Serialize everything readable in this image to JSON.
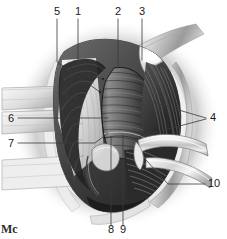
{
  "figure": {
    "medium": "grayscale pen-and-ink / airbrush medical illustration",
    "background_color": "#ffffff",
    "ink_color": "#3a3a3a",
    "width": 227,
    "height": 239,
    "signature": "Mc"
  },
  "labels": [
    {
      "id": "label-5",
      "text": "5",
      "x": 57,
      "y": 15,
      "position": "top"
    },
    {
      "id": "label-1",
      "text": "1",
      "x": 78,
      "y": 15,
      "position": "top"
    },
    {
      "id": "label-2",
      "text": "2",
      "x": 118,
      "y": 15,
      "position": "top"
    },
    {
      "id": "label-3",
      "text": "3",
      "x": 142,
      "y": 15,
      "position": "top"
    },
    {
      "id": "label-6",
      "text": "6",
      "x": 11,
      "y": 122,
      "position": "left"
    },
    {
      "id": "label-7",
      "text": "7",
      "x": 11,
      "y": 147,
      "position": "left"
    },
    {
      "id": "label-4",
      "text": "4",
      "x": 213,
      "y": 121,
      "position": "right"
    },
    {
      "id": "label-10",
      "text": "10",
      "x": 213,
      "y": 187,
      "position": "right"
    },
    {
      "id": "label-8",
      "text": "8",
      "x": 111,
      "y": 233,
      "position": "bottom"
    },
    {
      "id": "label-9",
      "text": "9",
      "x": 123,
      "y": 233,
      "position": "bottom"
    }
  ],
  "leaders": [
    {
      "id": "leader-5",
      "for": "5",
      "path": "M 57 19 L 57 62 L 100 92"
    },
    {
      "id": "leader-1",
      "for": "1",
      "path": "M 78 19 L 78 72 L 103 79"
    },
    {
      "id": "leader-2",
      "for": "2",
      "path": "M 118 19 L 118 68"
    },
    {
      "id": "leader-3",
      "for": "3",
      "path": "M 142 19 L 142 60"
    },
    {
      "id": "leader-6",
      "for": "6",
      "path": "M 18 118 L 108 118"
    },
    {
      "id": "leader-7",
      "for": "7",
      "path": "M 18 143 L 95 143 L 108 133"
    },
    {
      "id": "leader-4a",
      "for": "4",
      "path": "M 206 118 L 148 101"
    },
    {
      "id": "leader-4b",
      "for": "4",
      "path": "M 206 119 L 138 137"
    },
    {
      "id": "leader-10",
      "for": "10",
      "path": "M 205 184 L 168 184 L 146 160"
    },
    {
      "id": "leader-8",
      "for": "8",
      "path": "M 111 226 L 111 137"
    },
    {
      "id": "leader-9",
      "for": "9",
      "path": "M 123 226 L 123 135"
    }
  ]
}
